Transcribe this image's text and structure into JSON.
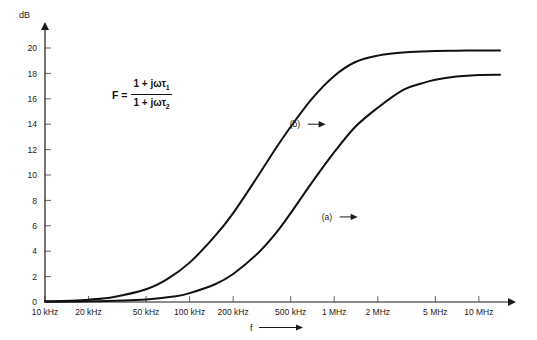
{
  "chart_data": {
    "type": "line",
    "title": "",
    "subtitle": "",
    "xlabel": "f",
    "ylabel": "dB",
    "grid": false,
    "legend_position": "inline-annotations",
    "xscale": "log",
    "x_tick_labels": [
      "10 kHz",
      "20 kHz",
      "50 kHz",
      "100 kHz",
      "200 kHz",
      "500 kHz",
      "1 MHz",
      "2 MHz",
      "5 MHz",
      "10 MHz"
    ],
    "x_tick_values_hz": [
      10000,
      20000,
      50000,
      100000,
      200000,
      500000,
      1000000,
      2000000,
      5000000,
      10000000
    ],
    "xlim_hz": [
      10000,
      14000000
    ],
    "y_tick_labels": [
      "0",
      "2",
      "4",
      "6",
      "8",
      "10",
      "12",
      "14",
      "16",
      "18",
      "20"
    ],
    "y_tick_values": [
      0,
      2,
      4,
      6,
      8,
      10,
      12,
      14,
      16,
      18,
      20
    ],
    "ylim": [
      0,
      21.5
    ],
    "series": [
      {
        "name": "(b)",
        "label": "(b)",
        "color": "#111111",
        "plateau_db": 19.8,
        "x_hz": [
          10000,
          15000,
          20000,
          30000,
          50000,
          70000,
          100000,
          150000,
          200000,
          300000,
          400000,
          500000,
          700000,
          1000000,
          1400000,
          2000000,
          3000000,
          4000000,
          5000000,
          7000000,
          10000000,
          14000000
        ],
        "y_db": [
          0.05,
          0.1,
          0.18,
          0.4,
          1.0,
          1.8,
          3.1,
          5.2,
          7.0,
          10.0,
          12.2,
          13.8,
          16.0,
          17.8,
          18.9,
          19.4,
          19.65,
          19.72,
          19.76,
          19.79,
          19.8,
          19.8
        ]
      },
      {
        "name": "(a)",
        "label": "(a)",
        "color": "#111111",
        "plateau_db": 17.9,
        "x_hz": [
          10000,
          20000,
          50000,
          80000,
          100000,
          150000,
          200000,
          300000,
          400000,
          500000,
          700000,
          1000000,
          1400000,
          2000000,
          3000000,
          4000000,
          5000000,
          7000000,
          10000000,
          14000000
        ],
        "y_db": [
          0.02,
          0.05,
          0.2,
          0.45,
          0.7,
          1.4,
          2.2,
          3.9,
          5.5,
          7.0,
          9.4,
          11.8,
          13.8,
          15.3,
          16.7,
          17.2,
          17.5,
          17.75,
          17.88,
          17.9
        ]
      }
    ],
    "annotations": [
      {
        "text": "(b)",
        "x_hz": 900000,
        "y_db": 14.0,
        "arrow": "right"
      },
      {
        "text": "(a)",
        "x_hz": 1500000,
        "y_db": 6.7,
        "arrow": "right"
      }
    ],
    "formula": {
      "lhs": "F =",
      "numerator_prefix": "1 + j",
      "numerator_omega": "ω",
      "numerator_tau": "τ",
      "numerator_sub": "1",
      "denominator_prefix": "1 + j",
      "denominator_omega": "ω",
      "denominator_tau": "τ",
      "denominator_sub": "2",
      "plain": "F = (1 + jωτ1) / (1 + jωτ2)"
    }
  },
  "axes": {
    "y_axis_title": "dB",
    "x_axis_title": "f"
  },
  "ticks": {
    "y": [
      {
        "label": "0",
        "value": 0
      },
      {
        "label": "2",
        "value": 2
      },
      {
        "label": "4",
        "value": 4
      },
      {
        "label": "6",
        "value": 6
      },
      {
        "label": "8",
        "value": 8
      },
      {
        "label": "10",
        "value": 10
      },
      {
        "label": "12",
        "value": 12
      },
      {
        "label": "14",
        "value": 14
      },
      {
        "label": "16",
        "value": 16
      },
      {
        "label": "18",
        "value": 18
      },
      {
        "label": "20",
        "value": 20
      }
    ],
    "x": [
      {
        "label": "10 kHz",
        "value": 10000
      },
      {
        "label": "20 kHz",
        "value": 20000
      },
      {
        "label": "50 kHz",
        "value": 50000
      },
      {
        "label": "100 kHz",
        "value": 100000
      },
      {
        "label": "200 kHz",
        "value": 200000
      },
      {
        "label": "500 kHz",
        "value": 500000
      },
      {
        "label": "1 MHz",
        "value": 1000000
      },
      {
        "label": "2 MHz",
        "value": 2000000
      },
      {
        "label": "5 MHz",
        "value": 5000000
      },
      {
        "label": "10 MHz",
        "value": 10000000
      }
    ]
  },
  "colors": {
    "background": "#ffffff",
    "axis": "#1a1a1a",
    "curve": "#111111",
    "text": "#1a1a1a"
  }
}
